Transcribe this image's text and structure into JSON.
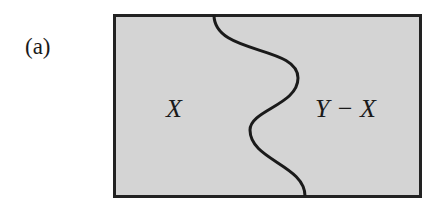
{
  "figure": {
    "panel_label": "(a)",
    "regions": [
      {
        "name": "left-region",
        "label": "X"
      },
      {
        "name": "right-region",
        "label": "Y − X"
      }
    ],
    "colors": {
      "fill": "#d4d4d4",
      "stroke": "#222222",
      "text": "#1a1a1a"
    }
  }
}
